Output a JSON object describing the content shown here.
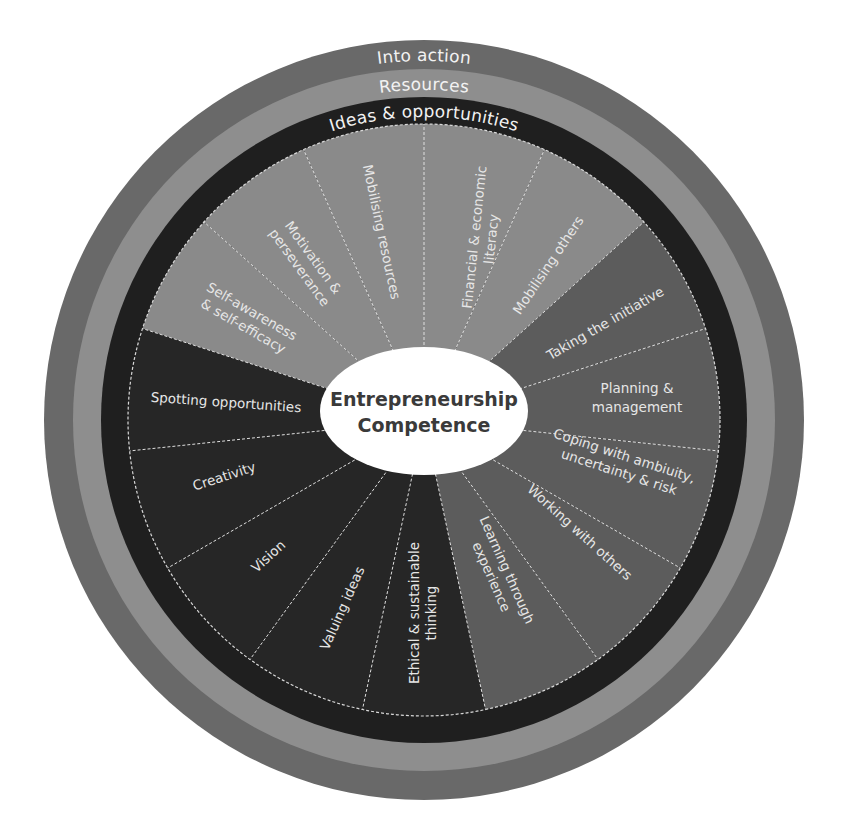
{
  "diagram": {
    "title": "Entrepreneurship Competence",
    "center": {
      "line1": "Entrepreneurship",
      "line2": "Competence"
    },
    "colors": {
      "outer_ring": "#696969",
      "middle_ring": "#8e8e8e",
      "inner_ring": "#1f1f1f",
      "ideas_wedges": "#262626",
      "resources_wedges": "#8a8a8a",
      "action_wedges": "#5c5c5c",
      "center_fill": "#ffffff",
      "divider": "#e0e0e0"
    },
    "rings": [
      {
        "label": "Into action"
      },
      {
        "label": "Resources"
      },
      {
        "label": "Ideas & opportunities"
      }
    ],
    "areas": {
      "ideas": {
        "label": "Ideas & opportunities",
        "competences": [
          {
            "line1": "Spotting opportunities",
            "line2": ""
          },
          {
            "line1": "Creativity",
            "line2": ""
          },
          {
            "line1": "Vision",
            "line2": ""
          },
          {
            "line1": "Valuing ideas",
            "line2": ""
          },
          {
            "line1": "Ethical & sustainable",
            "line2": "thinking"
          }
        ]
      },
      "resources": {
        "label": "Resources",
        "competences": [
          {
            "line1": "Self-awareness",
            "line2": "& self-efficacy"
          },
          {
            "line1": "Motivation &",
            "line2": "perseverance"
          },
          {
            "line1": "Mobilising resources",
            "line2": ""
          },
          {
            "line1": "Financial & economic",
            "line2": "literacy"
          },
          {
            "line1": "Mobilising others",
            "line2": ""
          }
        ]
      },
      "action": {
        "label": "Into action",
        "competences": [
          {
            "line1": "Taking the initiative",
            "line2": ""
          },
          {
            "line1": "Planning &",
            "line2": "management"
          },
          {
            "line1": "Coping with ambiuity,",
            "line2": "uncertainty & risk"
          },
          {
            "line1": "Working with others",
            "line2": ""
          },
          {
            "line1": "Learning through",
            "line2": "experience"
          }
        ]
      }
    }
  }
}
